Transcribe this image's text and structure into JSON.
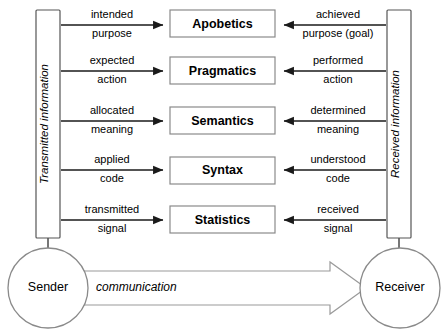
{
  "diagram": {
    "left_rail": {
      "label": "Transmitted information",
      "orientation": "vertical-bottom-to-top"
    },
    "right_rail": {
      "label": "Received information",
      "orientation": "vertical-bottom-to-top"
    },
    "layers": [
      {
        "name": "Apobetics",
        "left_label_line1": "intended",
        "left_label_line2": "purpose",
        "right_label_line1": "achieved",
        "right_label_line2": "purpose (goal)"
      },
      {
        "name": "Pragmatics",
        "left_label_line1": "expected",
        "left_label_line2": "action",
        "right_label_line1": "performed",
        "right_label_line2": "action"
      },
      {
        "name": "Semantics",
        "left_label_line1": "allocated",
        "left_label_line2": "meaning",
        "right_label_line1": "determined",
        "right_label_line2": "meaning"
      },
      {
        "name": "Syntax",
        "left_label_line1": "applied",
        "left_label_line2": "code",
        "right_label_line1": "understood",
        "right_label_line2": "code"
      },
      {
        "name": "Statistics",
        "left_label_line1": "transmitted",
        "left_label_line2": "signal",
        "right_label_line1": "received",
        "right_label_line2": "signal"
      }
    ],
    "sender": {
      "label": "Sender"
    },
    "receiver": {
      "label": "Receiver"
    },
    "communication": {
      "label": "communication",
      "direction": "sender-to-receiver"
    },
    "colors": {
      "background": "#ffffff",
      "box_stroke": "#8a8a8a",
      "rail_stroke": "#555555",
      "arrow_stroke": "#1a1a1a",
      "comm_arrow_stroke": "#9a9a9a",
      "text": "#000000"
    }
  }
}
